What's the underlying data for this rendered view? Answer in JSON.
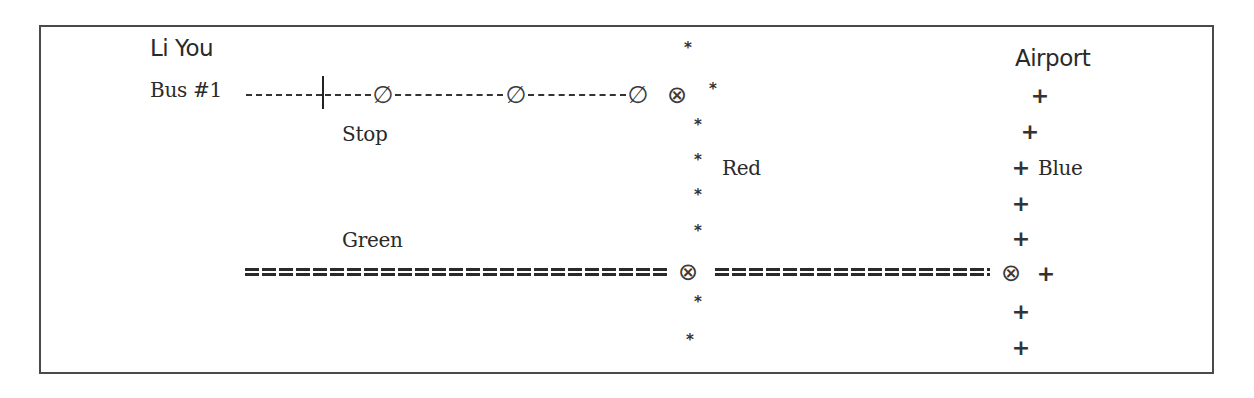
{
  "diagram": {
    "title_label": "Li You",
    "destination_label": "Airport",
    "lines": {
      "bus": {
        "label": "Bus #1",
        "stop_label": "Stop",
        "style": "dashed",
        "stop_symbol": "∅",
        "stop_count": 3
      },
      "red": {
        "label": "Red",
        "symbol": "*"
      },
      "green": {
        "label": "Green",
        "symbol": "="
      },
      "blue": {
        "label": "Blue",
        "symbol": "+"
      }
    },
    "symbols": {
      "transfer": "⊗",
      "stop": "∅",
      "red_marker": "*",
      "blue_marker": "+"
    },
    "colors": {
      "ink": "#2a2a2a",
      "frame": "#4a4a4a",
      "background": "#ffffff"
    }
  }
}
